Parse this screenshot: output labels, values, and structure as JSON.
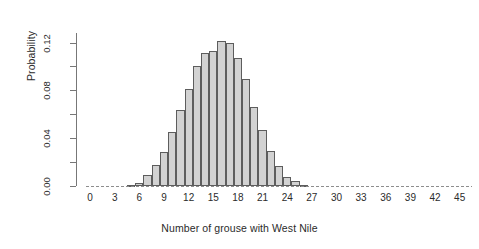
{
  "chart_data": {
    "type": "bar",
    "title": "",
    "subtitle": "",
    "xlabel": "Number of grouse with West Nile",
    "ylabel": "Probability",
    "xlim": [
      -0.5,
      46.5
    ],
    "ylim": [
      0.0,
      0.128
    ],
    "grid": false,
    "legend": null,
    "x_tick_labels": [
      "0",
      "3",
      "6",
      "9",
      "12",
      "15",
      "18",
      "21",
      "24",
      "27",
      "30",
      "33",
      "36",
      "39",
      "42",
      "45"
    ],
    "x_tick_values": [
      0,
      3,
      6,
      9,
      12,
      15,
      18,
      21,
      24,
      27,
      30,
      33,
      36,
      39,
      42,
      45
    ],
    "y_tick_labels": [
      "0.00",
      "0.04",
      "0.08",
      "0.12"
    ],
    "y_tick_values": [
      0.0,
      0.04,
      0.08,
      0.12
    ],
    "y_minor_tick_values": [
      0.02,
      0.06,
      0.1
    ],
    "bar_fill_color": "#d2d2d2",
    "bar_border_color": "#5d5d5d",
    "axis_color": "#777777",
    "categories": [
      0,
      1,
      2,
      3,
      4,
      5,
      6,
      7,
      8,
      9,
      10,
      11,
      12,
      13,
      14,
      15,
      16,
      17,
      18,
      19,
      20,
      21,
      22,
      23,
      24,
      25,
      26,
      27,
      28,
      29,
      30,
      31,
      32,
      33,
      34,
      35,
      36,
      37,
      38,
      39,
      40,
      41,
      42,
      43,
      44,
      45,
      46
    ],
    "values": [
      0.0,
      0.0,
      0.0,
      0.0,
      0.0001,
      0.0005,
      0.0017,
      0.0046,
      0.0104,
      0.02,
      0.033,
      0.048,
      0.062,
      0.072,
      0.08,
      0.083,
      0.079,
      0.068,
      0.054,
      0.0395,
      0.0265,
      0.0165,
      0.0094,
      0.005,
      0.0024,
      0.0011,
      0.0004,
      0.0002,
      0.0001,
      0.0,
      0.0,
      0.0,
      0.0,
      0.0,
      0.0,
      0.0,
      0.0,
      0.0,
      0.0,
      0.0,
      0.0,
      0.0,
      0.0,
      0.0,
      0.0,
      0.0,
      0.0
    ],
    "values_plotted": [
      0.0,
      0.0,
      0.0,
      0.0,
      0.0001,
      0.0008,
      0.0025,
      0.009,
      0.0175,
      0.0287,
      0.045,
      0.0633,
      0.081,
      0.1,
      0.111,
      0.113,
      0.1215,
      0.12,
      0.1075,
      0.0895,
      0.066,
      0.0465,
      0.029,
      0.0165,
      0.0078,
      0.0038,
      0.0012,
      0.0004,
      0.0001,
      0.0,
      0.0,
      0.0,
      0.0,
      0.0,
      0.0,
      0.0,
      0.0,
      0.0,
      0.0,
      0.0,
      0.0,
      0.0,
      0.0,
      0.0,
      0.0,
      0.0,
      0.0
    ],
    "peak_category": 16,
    "peak_value": 0.1215
  }
}
